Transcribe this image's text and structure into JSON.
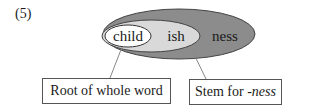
{
  "example_number": "(5)",
  "diagram": {
    "segments": [
      {
        "id": "root",
        "label": "child",
        "fill": "#ffffff"
      },
      {
        "id": "stem",
        "label": "ish",
        "fill": "#d9d9d9"
      },
      {
        "id": "word",
        "label": "ness",
        "fill": "#8c8c8c"
      }
    ],
    "callouts": [
      {
        "id": "root-callout",
        "text": "Root of whole word"
      },
      {
        "id": "stem-callout",
        "prefix": "Stem for ",
        "italic": "-ness"
      }
    ]
  }
}
